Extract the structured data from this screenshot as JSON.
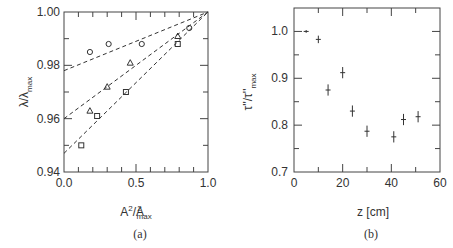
{
  "chart_data": [
    {
      "panel": "(a)",
      "type": "scatter",
      "xlabel": "A²/A²max",
      "ylabel": "λ/λmax",
      "xlim": [
        0.0,
        1.0
      ],
      "ylim": [
        0.94,
        1.0
      ],
      "xticks": [
        "0.0",
        "0.5",
        "1.0"
      ],
      "yticks": [
        "0.94",
        "0.96",
        "0.98",
        "1.00"
      ],
      "grid": false,
      "series": [
        {
          "name": "circles",
          "marker": "circle",
          "x": [
            0.18,
            0.31,
            0.54,
            0.87
          ],
          "y": [
            0.985,
            0.988,
            0.988,
            0.994
          ],
          "fit": {
            "x": [
              0.0,
              1.0
            ],
            "y": [
              0.978,
              1.0
            ]
          }
        },
        {
          "name": "triangles",
          "marker": "triangle",
          "x": [
            0.18,
            0.3,
            0.46,
            0.79
          ],
          "y": [
            0.963,
            0.972,
            0.981,
            0.991
          ],
          "fit": {
            "x": [
              0.0,
              1.0
            ],
            "y": [
              0.96,
              1.0
            ]
          }
        },
        {
          "name": "squares",
          "marker": "square",
          "x": [
            0.12,
            0.23,
            0.43,
            0.79
          ],
          "y": [
            0.95,
            0.961,
            0.97,
            0.988
          ],
          "fit": {
            "x": [
              0.0,
              1.0
            ],
            "y": [
              0.947,
              1.0
            ]
          }
        }
      ]
    },
    {
      "panel": "(b)",
      "type": "scatter",
      "xlabel": "z [cm]",
      "ylabel": "τ''/τ''max",
      "xlim": [
        0,
        60
      ],
      "ylim": [
        0.7,
        1.05
      ],
      "xticks": [
        "0",
        "20",
        "40",
        "60"
      ],
      "yticks": [
        "0.7",
        "0.8",
        "0.9",
        "1.0"
      ],
      "grid": false,
      "series": [
        {
          "name": "data",
          "marker": "errorbar",
          "x": [
            5,
            10,
            14,
            20,
            24,
            30,
            41,
            45,
            51
          ],
          "y": [
            1.0,
            0.983,
            0.875,
            0.912,
            0.83,
            0.787,
            0.775,
            0.812,
            0.818
          ],
          "yerr": [
            0.003,
            0.008,
            0.012,
            0.012,
            0.012,
            0.012,
            0.012,
            0.012,
            0.012
          ]
        }
      ]
    }
  ],
  "panels": {
    "a": {
      "caption": "(a)",
      "xlabel_main": "A",
      "xlabel_sup": "2",
      "xlabel_slash": "/",
      "xlabel_denom": "A",
      "xlabel_denom_sub": "max",
      "ylabel_main": "λ/λ",
      "ylabel_sub": "max",
      "xticks": [
        "0.0",
        "0.5",
        "1.0"
      ],
      "yticks": [
        "0.94",
        "0.96",
        "0.98",
        "1.00"
      ]
    },
    "b": {
      "caption": "(b)",
      "xlabel": "z  [cm]",
      "ylabel_main": "τ''/τ''",
      "ylabel_sub": "max",
      "xticks": [
        "0",
        "20",
        "40",
        "60"
      ],
      "yticks": [
        "0.7",
        "0.8",
        "0.9",
        "1.0"
      ]
    }
  }
}
